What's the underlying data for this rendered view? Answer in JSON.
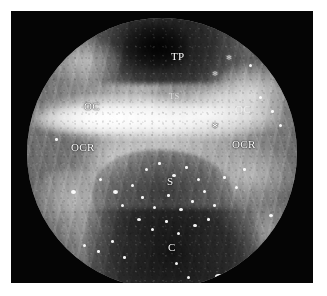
{
  "figure": {
    "kind": "endoscopic-photograph",
    "modality": "Endoscopic endonasal transsphenoidal view",
    "view_shape": "circular",
    "color_mode": "grayscale",
    "frame_color": "#050505",
    "page_background": "#ffffff",
    "label_color": "#ffffff"
  },
  "labels": [
    {
      "id": "tp",
      "text": "TP",
      "meaning": "tuberculum / planum",
      "x": 171,
      "y": 57,
      "style": "normal"
    },
    {
      "id": "oc-left",
      "text": "OC",
      "meaning": "optic canal, left",
      "x": 84,
      "y": 107,
      "style": "normal"
    },
    {
      "id": "oc-right",
      "text": "OC",
      "meaning": "optic canal, right",
      "x": 235,
      "y": 110,
      "style": "faint"
    },
    {
      "id": "ts",
      "text": "TS",
      "meaning": "tuberculum sellae",
      "x": 169,
      "y": 97,
      "style": "faint"
    },
    {
      "id": "ocr-left",
      "text": "OCR",
      "meaning": "opticocarotid recess, left",
      "x": 71,
      "y": 148,
      "style": "normal"
    },
    {
      "id": "ocr-right",
      "text": "OCR",
      "meaning": "opticocarotid recess, right",
      "x": 232,
      "y": 145,
      "style": "normal"
    },
    {
      "id": "s",
      "text": "S",
      "meaning": "sella",
      "x": 167,
      "y": 182,
      "style": "normal"
    },
    {
      "id": "c",
      "text": "C",
      "meaning": "clivus",
      "x": 168,
      "y": 248,
      "style": "normal"
    }
  ],
  "markers": [
    {
      "id": "asterisk-right-carotid",
      "text": "*",
      "meaning": "carotid prominence, right",
      "x": 212,
      "y": 128
    },
    {
      "id": "asterisk-upper-right",
      "text": "*",
      "meaning": "carotid prominence",
      "x": 226,
      "y": 60
    },
    {
      "id": "asterisk-left-lower",
      "text": "*",
      "meaning": "landmark",
      "x": 212,
      "y": 76
    }
  ],
  "geometry": {
    "frame": {
      "x": 11,
      "y": 11,
      "width": 302,
      "height": 272
    },
    "circle": {
      "center_x": 162,
      "center_y": 154,
      "radius": 135
    }
  }
}
